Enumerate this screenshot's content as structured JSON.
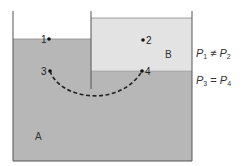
{
  "diagram": {
    "fluids": [
      {
        "id": "A",
        "label": "A",
        "color": "#b7b7b7"
      },
      {
        "id": "B",
        "label": "B",
        "color": "#e3e3e3"
      }
    ],
    "points": [
      {
        "id": "1",
        "label": "1",
        "x": 49,
        "y": 39,
        "label_side": "left"
      },
      {
        "id": "2",
        "label": "2",
        "x": 143,
        "y": 40,
        "label_side": "right"
      },
      {
        "id": "3",
        "label": "3",
        "x": 50,
        "y": 71,
        "label_side": "left"
      },
      {
        "id": "4",
        "label": "4",
        "x": 142,
        "y": 71,
        "label_side": "right"
      }
    ],
    "path": {
      "from": "3",
      "to": "4",
      "style": "dashed"
    },
    "equations": [
      {
        "lhs_var": "P",
        "lhs_sub": "1",
        "op": "≠",
        "rhs_var": "P",
        "rhs_sub": "2"
      },
      {
        "lhs_var": "P",
        "lhs_sub": "3",
        "op": "=",
        "rhs_var": "P",
        "rhs_sub": "4"
      }
    ],
    "colors": {
      "wall": "#555555",
      "fluid_a": "#b7b7b7",
      "fluid_b": "#e3e3e3",
      "background": "#ffffff"
    }
  }
}
